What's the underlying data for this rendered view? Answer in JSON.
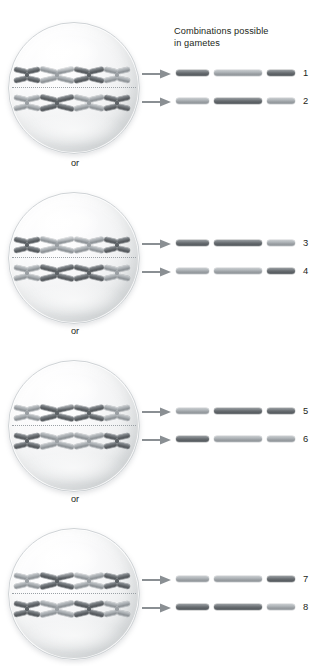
{
  "caption": {
    "line1": "Combinations possible",
    "line2": "in gametes"
  },
  "separator": {
    "label": "or"
  },
  "colors": {
    "dark_chromosome": "#5d6266",
    "light_chromosome": "#9ba0a4",
    "cell_fill": "#eef0f1",
    "arrow": "#8a8f93",
    "text": "#231f20",
    "plate_line": "#9aa0a5"
  },
  "groups": [
    {
      "id": "group-1",
      "top": 22,
      "cell": {
        "top_row": [
          "dark",
          "light",
          "dark",
          "light"
        ],
        "bottom_row": [
          "light",
          "dark",
          "light",
          "dark"
        ]
      },
      "gametes": [
        {
          "number": "1",
          "bars": [
            {
              "shade": "dark",
              "length": 33
            },
            {
              "shade": "light",
              "length": 48
            },
            {
              "shade": "dark",
              "length": 28
            }
          ]
        },
        {
          "number": "2",
          "bars": [
            {
              "shade": "light",
              "length": 33
            },
            {
              "shade": "dark",
              "length": 48
            },
            {
              "shade": "light",
              "length": 28
            }
          ]
        }
      ]
    },
    {
      "id": "group-2",
      "top": 192,
      "cell": {
        "top_row": [
          "dark",
          "light",
          "light",
          "dark"
        ],
        "bottom_row": [
          "light",
          "dark",
          "dark",
          "light"
        ]
      },
      "gametes": [
        {
          "number": "3",
          "bars": [
            {
              "shade": "dark",
              "length": 33
            },
            {
              "shade": "dark",
              "length": 48
            },
            {
              "shade": "light",
              "length": 28
            }
          ]
        },
        {
          "number": "4",
          "bars": [
            {
              "shade": "light",
              "length": 33
            },
            {
              "shade": "light",
              "length": 48
            },
            {
              "shade": "dark",
              "length": 28
            }
          ]
        }
      ]
    },
    {
      "id": "group-3",
      "top": 360,
      "cell": {
        "top_row": [
          "light",
          "dark",
          "dark",
          "light"
        ],
        "bottom_row": [
          "dark",
          "light",
          "light",
          "dark"
        ]
      },
      "gametes": [
        {
          "number": "5",
          "bars": [
            {
              "shade": "light",
              "length": 33
            },
            {
              "shade": "dark",
              "length": 48
            },
            {
              "shade": "dark",
              "length": 28
            }
          ]
        },
        {
          "number": "6",
          "bars": [
            {
              "shade": "dark",
              "length": 33
            },
            {
              "shade": "light",
              "length": 48
            },
            {
              "shade": "light",
              "length": 28
            }
          ]
        }
      ]
    },
    {
      "id": "group-4",
      "top": 528,
      "cell": {
        "top_row": [
          "light",
          "dark",
          "light",
          "dark"
        ],
        "bottom_row": [
          "dark",
          "light",
          "dark",
          "light"
        ]
      },
      "gametes": [
        {
          "number": "7",
          "bars": [
            {
              "shade": "light",
              "length": 33
            },
            {
              "shade": "light",
              "length": 48
            },
            {
              "shade": "dark",
              "length": 28
            }
          ]
        },
        {
          "number": "8",
          "bars": [
            {
              "shade": "dark",
              "length": 33
            },
            {
              "shade": "dark",
              "length": 48
            },
            {
              "shade": "light",
              "length": 28
            }
          ]
        }
      ]
    }
  ],
  "separators": [
    {
      "id": "or-1",
      "top": 158
    },
    {
      "id": "or-2",
      "top": 326
    },
    {
      "id": "or-3",
      "top": 494
    }
  ]
}
